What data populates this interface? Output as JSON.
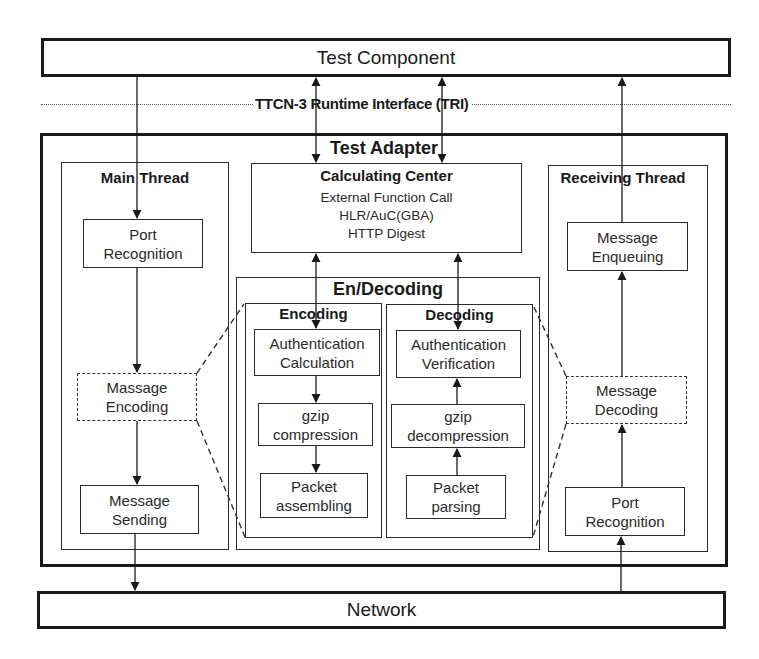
{
  "diagram": {
    "test_component": {
      "label": "Test Component"
    },
    "interface_line": {
      "label": "TTCN-3 Runtime Interface (TRI)"
    },
    "test_adapter": {
      "label": "Test Adapter",
      "main_thread": {
        "label": "Main Thread",
        "steps": [
          "Port\nRecognition",
          "Massage\nEncoding",
          "Message\nSending"
        ],
        "step_lines": [
          [
            "Port",
            "Recognition"
          ],
          [
            "Massage",
            "Encoding"
          ],
          [
            "Message",
            "Sending"
          ]
        ]
      },
      "calculating_center": {
        "label": "Calculating Center",
        "lines": [
          "External Function Call",
          "HLR/AuC(GBA)",
          "HTTP Digest"
        ]
      },
      "en_decoding": {
        "label": "En/Decoding",
        "encoding": {
          "label": "Encoding",
          "step_lines": [
            [
              "Authentication",
              "Calculation"
            ],
            [
              "gzip",
              "compression"
            ],
            [
              "Packet",
              "assembling"
            ]
          ]
        },
        "decoding": {
          "label": "Decoding",
          "step_lines": [
            [
              "Authentication",
              "Verification"
            ],
            [
              "gzip",
              "decompression"
            ],
            [
              "Packet",
              "parsing"
            ]
          ]
        }
      },
      "receiving_thread": {
        "label": "Receiving Thread",
        "step_lines": [
          [
            "Message",
            "Enqueuing"
          ],
          [
            "Message",
            "Decoding"
          ],
          [
            "Port",
            "Recognition"
          ]
        ]
      }
    },
    "network": {
      "label": "Network"
    },
    "colors": {
      "stroke": "#1a1a1a",
      "background": "#ffffff"
    }
  }
}
